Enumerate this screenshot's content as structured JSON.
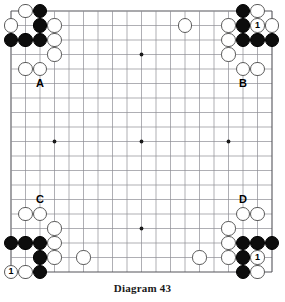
{
  "figure": {
    "caption": "Diagram 43",
    "kind": "go-board-diagram"
  },
  "board": {
    "size": 19,
    "origin_x": 11,
    "origin_y": 11,
    "spacing": 14.5,
    "stone_diameter": 14.2,
    "line_color": "#8d8d93",
    "edge_color": "#55555b",
    "background": "#ffffff",
    "star_points": [
      {
        "col": 4,
        "row": 4
      },
      {
        "col": 10,
        "row": 4
      },
      {
        "col": 16,
        "row": 4
      },
      {
        "col": 4,
        "row": 10
      },
      {
        "col": 10,
        "row": 10
      },
      {
        "col": 16,
        "row": 10
      },
      {
        "col": 4,
        "row": 16
      },
      {
        "col": 10,
        "row": 16
      },
      {
        "col": 16,
        "row": 16
      }
    ],
    "star_point_radius": 1.9
  },
  "stones": {
    "black": [
      {
        "col": 3,
        "row": 1
      },
      {
        "col": 3,
        "row": 2
      },
      {
        "col": 1,
        "row": 3
      },
      {
        "col": 2,
        "row": 3
      },
      {
        "col": 3,
        "row": 3
      },
      {
        "col": 17,
        "row": 1
      },
      {
        "col": 17,
        "row": 2
      },
      {
        "col": 17,
        "row": 3
      },
      {
        "col": 18,
        "row": 3
      },
      {
        "col": 19,
        "row": 3
      },
      {
        "col": 1,
        "row": 17
      },
      {
        "col": 2,
        "row": 17
      },
      {
        "col": 3,
        "row": 17
      },
      {
        "col": 3,
        "row": 18
      },
      {
        "col": 3,
        "row": 19
      },
      {
        "col": 17,
        "row": 17
      },
      {
        "col": 18,
        "row": 17
      },
      {
        "col": 19,
        "row": 17
      },
      {
        "col": 17,
        "row": 18
      },
      {
        "col": 17,
        "row": 19
      }
    ],
    "white": [
      {
        "col": 2,
        "row": 1
      },
      {
        "col": 1,
        "row": 2
      },
      {
        "col": 4,
        "row": 2
      },
      {
        "col": 4,
        "row": 3
      },
      {
        "col": 4,
        "row": 4
      },
      {
        "col": 2,
        "row": 5
      },
      {
        "col": 3,
        "row": 5
      },
      {
        "col": 13,
        "row": 2
      },
      {
        "col": 16,
        "row": 2
      },
      {
        "col": 18,
        "row": 1
      },
      {
        "col": 19,
        "row": 2
      },
      {
        "col": 16,
        "row": 3
      },
      {
        "col": 16,
        "row": 4
      },
      {
        "col": 17,
        "row": 5
      },
      {
        "col": 18,
        "row": 5
      },
      {
        "col": 2,
        "row": 15
      },
      {
        "col": 3,
        "row": 15
      },
      {
        "col": 4,
        "row": 16
      },
      {
        "col": 4,
        "row": 17
      },
      {
        "col": 4,
        "row": 18
      },
      {
        "col": 2,
        "row": 19
      },
      {
        "col": 6,
        "row": 18
      },
      {
        "col": 17,
        "row": 15
      },
      {
        "col": 18,
        "row": 15
      },
      {
        "col": 16,
        "row": 16
      },
      {
        "col": 16,
        "row": 17
      },
      {
        "col": 16,
        "row": 18
      },
      {
        "col": 14,
        "row": 18
      },
      {
        "col": 18,
        "row": 19
      }
    ],
    "numbered": [
      {
        "col": 18,
        "row": 2,
        "color": "white",
        "number": "1"
      },
      {
        "col": 1,
        "row": 19,
        "color": "white",
        "number": "1"
      },
      {
        "col": 18,
        "row": 18,
        "color": "white",
        "number": "1"
      }
    ]
  },
  "labels": [
    {
      "text": "A",
      "col": 3,
      "row": 6,
      "name": "board-label-a"
    },
    {
      "text": "B",
      "col": 17,
      "row": 6,
      "name": "board-label-b"
    },
    {
      "text": "C",
      "col": 3,
      "row": 14,
      "name": "board-label-c"
    },
    {
      "text": "D",
      "col": 17,
      "row": 14,
      "name": "board-label-d"
    }
  ]
}
